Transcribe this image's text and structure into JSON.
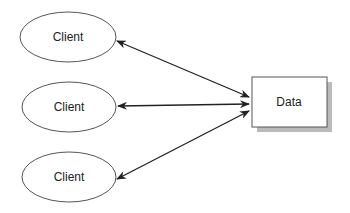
{
  "diagram": {
    "clients": [
      {
        "label": "Client"
      },
      {
        "label": "Client"
      },
      {
        "label": "Client"
      }
    ],
    "data_node": {
      "label": "Data"
    },
    "edges": [
      {
        "from": "client-1",
        "to": "data",
        "type": "bidirectional"
      },
      {
        "from": "client-2",
        "to": "data",
        "type": "bidirectional"
      },
      {
        "from": "client-3",
        "to": "data",
        "type": "bidirectional"
      }
    ],
    "colors": {
      "stroke": "#555555",
      "arrow": "#222222",
      "shadow": "#bbbbbb"
    }
  }
}
